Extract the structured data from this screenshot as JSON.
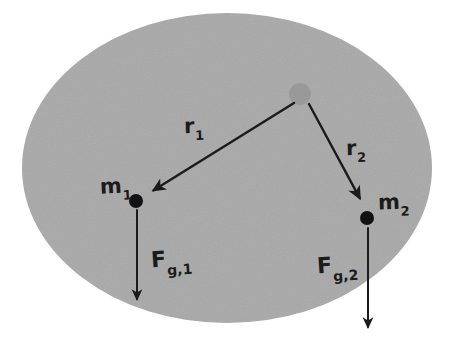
{
  "figure": {
    "type": "physics-diagram",
    "background_color": "#ffffff",
    "body": {
      "shape": "ellipse",
      "fill_color": "#a8a8a8",
      "center_x": 227,
      "center_y": 168,
      "radius_x": 205,
      "radius_y": 155
    },
    "source_point": {
      "name": "center-of-mass",
      "x": 300,
      "y": 94,
      "radius": 11,
      "fill_color": "#999999"
    },
    "masses": [
      {
        "id": "m1",
        "label_base": "m",
        "label_sub": "1",
        "x": 136,
        "y": 201,
        "radius": 7,
        "fill_color": "#111111"
      },
      {
        "id": "m2",
        "label_base": "m",
        "label_sub": "2",
        "x": 367,
        "y": 218,
        "radius": 7,
        "fill_color": "#111111"
      }
    ],
    "radius_vectors": [
      {
        "id": "r1",
        "label_base": "r",
        "label_sub": "1",
        "from_x": 294,
        "from_y": 103,
        "to_x": 146,
        "to_y": 195,
        "stroke_color": "#1b1b1b",
        "stroke_width": 2.4
      },
      {
        "id": "r2",
        "label_base": "r",
        "label_sub": "2",
        "from_x": 309,
        "from_y": 104,
        "to_x": 364,
        "to_y": 206,
        "stroke_color": "#1b1b1b",
        "stroke_width": 2.4
      }
    ],
    "force_vectors": [
      {
        "id": "Fg1",
        "label_base": "F",
        "label_sub": "g,1",
        "from_x": 137,
        "from_y": 210,
        "to_x": 137,
        "to_y": 306,
        "stroke_color": "#1b1b1b",
        "stroke_width": 2.0
      },
      {
        "id": "Fg2",
        "label_base": "F",
        "label_sub": "g,2",
        "from_x": 368,
        "from_y": 228,
        "to_x": 368,
        "to_y": 334,
        "stroke_color": "#1b1b1b",
        "stroke_width": 2.0
      }
    ]
  }
}
